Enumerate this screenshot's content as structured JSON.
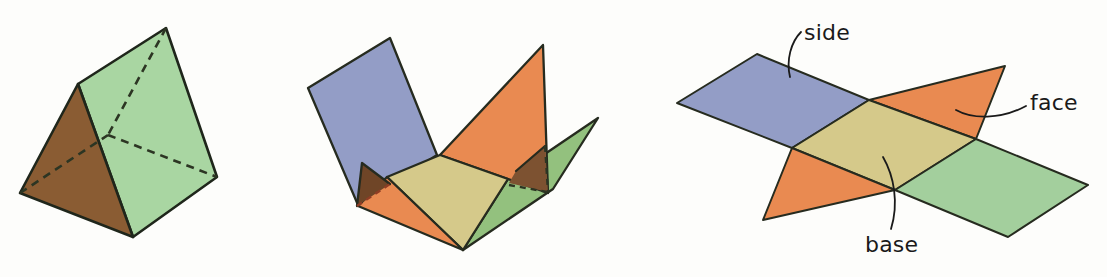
{
  "page": {
    "background": "#fdfdfb"
  },
  "labels": {
    "side": "side",
    "face": "face",
    "base": "base"
  },
  "palette": {
    "stroke": "#262b1f",
    "prism_stroke": "#1f261b",
    "dash_dark": "#2c3523",
    "dash_red": "#8f3d24",
    "ink": "#1a1a1a",
    "blue": "#939dc6",
    "yellow": "#d5c98a",
    "orange": "#e98a51",
    "green_prism": "#a9d6a2",
    "green_mid": "#93c17e",
    "green_net": "#a3cf9d",
    "brown": "#8a5c33",
    "brown_overlap": "#7d5231",
    "brown_overlap_dark": "#6f4527"
  },
  "scene": {
    "width": 1107,
    "height": 277,
    "figures": [
      {
        "name": "solid-triangular-prism",
        "stroke": "prism_stroke",
        "stroke_width": 2.6,
        "dash_pattern": "8 6",
        "polys": [
          {
            "name": "prism-side-rectangle",
            "fill": "green_prism",
            "points": "78,84 166,28 217,177 133,237"
          },
          {
            "name": "prism-front-triangle",
            "fill": "brown",
            "points": "78,84 20,193 133,237"
          }
        ],
        "dashed": [
          {
            "name": "prism-hidden-edge-top",
            "color": "dash_dark",
            "points": "166,28 108,135"
          },
          {
            "name": "prism-hidden-edge-left",
            "color": "dash_dark",
            "points": "20,193 108,135"
          },
          {
            "name": "prism-hidden-edge-right",
            "color": "dash_dark",
            "points": "108,135 217,177"
          }
        ]
      },
      {
        "name": "partially-unfolded-net",
        "stroke": "stroke",
        "stroke_width": 2.3,
        "dash_pattern": "6 5",
        "polys": [
          {
            "name": "net-side-rectangle-green",
            "fill": "green_mid",
            "points": "508,179 598,118 553,189 463,250"
          },
          {
            "name": "net-face-triangle-raised",
            "fill": "orange",
            "points": "543,45 440,155 548,193"
          },
          {
            "name": "net-overlap-quad",
            "fill": "brown_overlap",
            "points": "516,171 545,146 548,192 509,183",
            "no_stroke": true
          },
          {
            "name": "net-side-rectangle-blue",
            "fill": "blue",
            "points": "390,38 437,155 358,205 308,88"
          },
          {
            "name": "net-base-rectangle-yellow",
            "fill": "yellow",
            "points": "440,155 508,179 463,250 387,177"
          },
          {
            "name": "net-face-triangle-flat",
            "fill": "orange",
            "points": "358,206 387,177 463,250"
          },
          {
            "name": "net-overlap-triangle",
            "fill": "brown_overlap_dark",
            "points": "362,163 390,184 357,206",
            "no_stroke": true
          }
        ],
        "lines": [
          {
            "name": "net-overlap-quad-top-edge",
            "points": "516,171 545,146"
          },
          {
            "name": "net-overlap-triangle-edges",
            "points": "390,184 362,163 357,206"
          }
        ],
        "dashed": [
          {
            "name": "net-hidden-edge-vertical",
            "color": "dash_dark",
            "points": "545,146 548,192"
          },
          {
            "name": "net-hidden-edge-horizontal",
            "color": "dash_dark",
            "points": "509,185 547,192"
          },
          {
            "name": "net-hidden-edge-red",
            "color": "dash_red",
            "points": "357,206 390,184"
          }
        ]
      },
      {
        "name": "flat-net",
        "stroke": "stroke",
        "stroke_width": 2,
        "dash_pattern": "6 5",
        "polys": [
          {
            "name": "flatnet-side-rectangle-blue",
            "fill": "blue",
            "points": "757,54 869,100 792,148 677,103"
          },
          {
            "name": "flatnet-face-triangle-top",
            "fill": "orange",
            "points": "869,100 1005,66 976,139"
          },
          {
            "name": "flatnet-base-rectangle-yellow",
            "fill": "yellow",
            "points": "869,100 976,139 895,190 792,148"
          },
          {
            "name": "flatnet-face-triangle-bottom",
            "fill": "orange",
            "points": "792,148 895,190 763,220"
          },
          {
            "name": "flatnet-side-rectangle-green",
            "fill": "green_net",
            "points": "976,139 1088,185 1008,237 895,190"
          }
        ],
        "leaders": [
          {
            "name": "side-leader-line",
            "d": "M 801,32 C 791,42 786,60 790,77"
          },
          {
            "name": "face-leader-line",
            "d": "M 1026,106 C 1000,120 972,119 956,110"
          },
          {
            "name": "base-leader-line",
            "d": "M 883,157 C 894,176 899,203 891,229"
          }
        ]
      }
    ]
  }
}
